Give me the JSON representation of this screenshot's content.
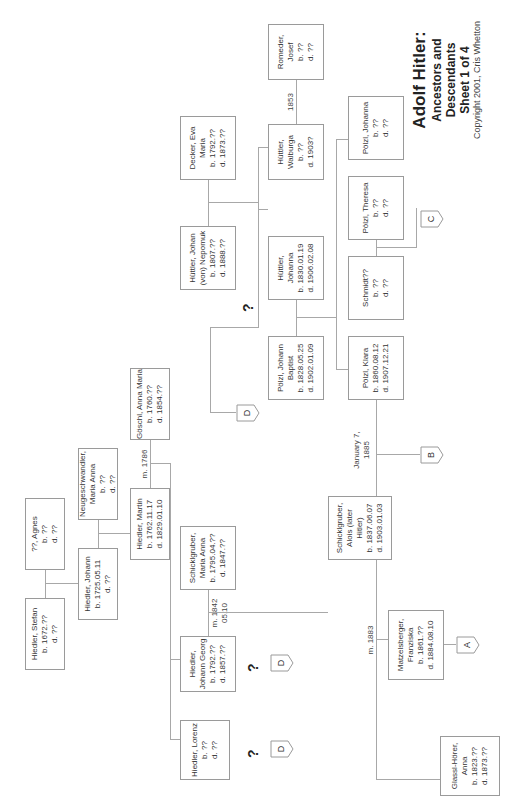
{
  "title": {
    "main": "Adolf Hitler:",
    "subtitle": "Ancestors and Descendants",
    "sheet": "Sheet 1 of 4",
    "copyright": "Copyright 2001, Cris Whetton"
  },
  "people": {
    "hiedler_stefan": {
      "name": "Hiedler, Stefan",
      "born": "b. 1672.??",
      "died": "d. ??"
    },
    "agnes": {
      "name": "??, Agnes",
      "born": "b. ??",
      "died": "d. ??"
    },
    "hiedler_johann": {
      "name": "Hiedler, Johann",
      "born": "b. 1725.05.11",
      "died": "d. ??"
    },
    "neugeschwandler": {
      "name1": "Neugeschwandler,",
      "name2": "Maria Anna",
      "born": "b. ??",
      "died": "d. ??"
    },
    "hiedler_martin": {
      "name": "Hiedler, Martin",
      "born": "b. 1762.11.17",
      "died": "d. 1829.01.10"
    },
    "goschl": {
      "name": "Göschl, Anna Maria",
      "born": "b. 1760.??",
      "died": "d. 1854.??"
    },
    "hiedler_lorenz": {
      "name": "Hiedler, Lorenz",
      "born": "b. ??",
      "died": "d. ??"
    },
    "hiedler_johann_georg": {
      "name1": "Hiedler,",
      "name2": "Johann Georg",
      "born": "b. 1792.??",
      "died": "d. 1857.??"
    },
    "schicklgruber_maria": {
      "name1": "Schicklgruber,",
      "name2": "Maria Anna",
      "born": "b. 1795.04.??",
      "died": "d. 1847.??"
    },
    "huttler_nepomuk": {
      "name1": "Hüttler, Johan",
      "name2": "(von) Nepomuk",
      "born": "b. 1807.??",
      "died": "d. 1888.??"
    },
    "decker": {
      "name1": "Decker, Eva",
      "name2": "Maria",
      "born": "b. 1792.??",
      "died": "d. 1873.??"
    },
    "polzl_johann": {
      "name1": "Pölzl, Johann",
      "name2": "Baptist",
      "born": "b. 1828.05.25",
      "died": "d. 1902.01.09"
    },
    "huttler_johanna": {
      "name1": "Hüttler,",
      "name2": "Johanna",
      "born": "b. 1830.01.19",
      "died": "d. 1906.02.08"
    },
    "huttler_walburga": {
      "name1": "Hüttler,",
      "name2": "Walburga",
      "born": "b. ??",
      "died": "d. 1903?"
    },
    "romeder": {
      "name1": "Romeder,",
      "name2": "Josef",
      "born": "b. ??",
      "died": "d. ??"
    },
    "alois": {
      "name1": "Schicklgruber,",
      "name2": "Alois (later",
      "name3": "Hitler)",
      "born": "b. 1837.06.07",
      "died": "d. 1903.01.03"
    },
    "polzl_klara": {
      "name": "Pölzl, Klara",
      "born": "b. 1860.08.12",
      "died": "d. 1907.12.21"
    },
    "schmidt": {
      "name": "Schmidt??",
      "born": "b. ??",
      "died": "d. ??"
    },
    "polzl_theresa": {
      "name": "Pölzl, Theresa",
      "born": "b. ??",
      "died": "d. ??"
    },
    "polzl_johanna": {
      "name": "Pölzl, Johanna",
      "born": "b. ??",
      "died": "d. ??"
    },
    "glassl": {
      "name1": "Glassl-Hörer,",
      "name2": "Anna",
      "born": "b. 1823.??",
      "died": "d. 1873.??"
    },
    "matzelsberger": {
      "name1": "Matzelsberger,",
      "name2": "Franziska",
      "born": "b. 1861.??",
      "died": "d. 1884.08.10"
    }
  },
  "marriages": {
    "m1786": "m. 1786",
    "m1842a": "m. 1842",
    "m1842b": "05.10",
    "m1853": "1853",
    "m1885a": "January 7,",
    "m1885b": "1885",
    "m1883": "m. 1883"
  },
  "connectors": {
    "a": "A",
    "b": "B",
    "c": "C",
    "d": "D"
  },
  "unknown_mark": "?"
}
